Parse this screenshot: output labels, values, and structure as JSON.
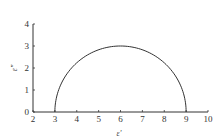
{
  "chart_data": {
    "type": "line",
    "title": "",
    "xlabel": "ε'",
    "ylabel": "ε\"",
    "xlim": [
      2,
      10
    ],
    "ylim": [
      0,
      4
    ],
    "xticks": [
      2,
      3,
      4,
      5,
      6,
      7,
      8,
      9,
      10
    ],
    "yticks": [
      0,
      1,
      2,
      3,
      4
    ],
    "grid": false,
    "legend": null,
    "series": [
      {
        "name": "Cole-Cole semicircle",
        "shape": "semicircle",
        "center": [
          6,
          0
        ],
        "radius": 3,
        "x": [
          3,
          3.5,
          4,
          4.5,
          5,
          5.5,
          6,
          6.5,
          7,
          7.5,
          8,
          8.5,
          9
        ],
        "y": [
          0,
          1.66,
          2.24,
          2.6,
          2.83,
          2.96,
          3.0,
          2.96,
          2.83,
          2.6,
          2.24,
          1.66,
          0
        ],
        "color": "#333333"
      }
    ]
  },
  "axis": {
    "x_label": "ε'",
    "y_label": "ε\"",
    "x_ticks": [
      "2",
      "3",
      "4",
      "5",
      "6",
      "7",
      "8",
      "9",
      "10"
    ],
    "y_ticks": [
      "0",
      "1",
      "2",
      "3",
      "4"
    ]
  },
  "colors": {
    "line": "#333333",
    "axis": "#333333",
    "text": "#333333"
  }
}
